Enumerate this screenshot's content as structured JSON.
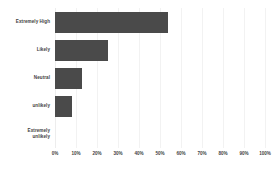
{
  "chart_data": {
    "type": "bar",
    "orientation": "horizontal",
    "title": "",
    "subtitle": "",
    "xlabel": "",
    "ylabel": "",
    "categories": [
      "Extremely High",
      "Likely",
      "Neutral",
      "unlikely",
      "Extremely\nunlikely"
    ],
    "values": [
      54,
      25,
      13,
      8,
      0
    ],
    "value_suffix": "%",
    "xlim": [
      0,
      100
    ],
    "x_ticks": [
      "0%",
      "10%",
      "20%",
      "30%",
      "40%",
      "50%",
      "60%",
      "70%",
      "80%",
      "90%",
      "100%"
    ],
    "x_tick_values": [
      0,
      10,
      20,
      30,
      40,
      50,
      60,
      70,
      80,
      90,
      100
    ],
    "grid": true,
    "grid_axis": "x",
    "legend": false,
    "legend_position": "none",
    "bar_color": "#4a4a4a",
    "grid_color": "#f2f2f2",
    "background_color": "#ffffff",
    "text_color": "#3f3f3f"
  }
}
